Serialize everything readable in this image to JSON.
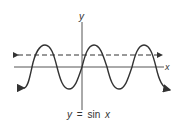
{
  "diagram": {
    "type": "function-graph",
    "equation_label": {
      "y": "y",
      "eq": "=",
      "fn": "sin",
      "x": "x"
    },
    "axes": {
      "x_label": "x",
      "y_label": "y"
    },
    "curve": "sine",
    "reference_line": "dashed horizontal line with arrows at both ends, above x-axis",
    "colors": {
      "ink": "#333333",
      "background": "#ffffff"
    }
  }
}
